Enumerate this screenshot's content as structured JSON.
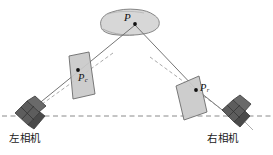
{
  "figure": {
    "background_color": "#ffffff",
    "width": 273,
    "height": 155
  },
  "colors": {
    "plane_fill": "#c9c9c9",
    "plane_stroke": "#6b6b6b",
    "blob_fill": "#d7d7d7",
    "blob_stroke": "#7a7a7a",
    "camera_body": "#5d5d5d",
    "camera_dark": "#4a4a4a",
    "camera_stroke": "#3a3a3a",
    "ray_line": "#6e6e6e",
    "baseline_dash": "#8a8a8a",
    "epipolar_dash": "#9a9a9a",
    "point_marker": "#111111",
    "text": "#1a1a1a"
  },
  "labels": {
    "object_point": "P",
    "left_image_point": "P",
    "left_image_point_sub": "c",
    "right_image_point": "P",
    "right_image_point_sub": "r",
    "left_camera": "左相机",
    "right_camera": "右相机"
  },
  "elements": {
    "object_blob_name": "3D object surface",
    "left_plane_name": "left image plane",
    "right_plane_name": "right image plane",
    "baseline_name": "camera baseline",
    "left_ray_name": "left projection ray",
    "right_ray_name": "right projection ray",
    "left_epipolar_name": "left epipolar line",
    "right_epipolar_name": "right epipolar line"
  }
}
